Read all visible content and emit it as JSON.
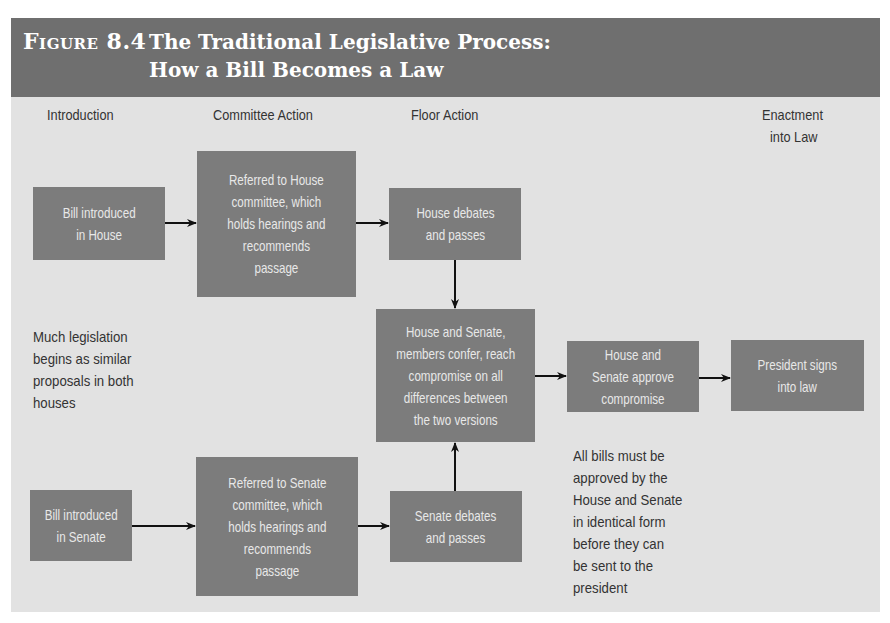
{
  "figure": {
    "label_prefix": "Figure",
    "label_number": "8.4",
    "title_line1": "The Traditional Legislative Process:",
    "title_line2": "How a Bill Becomes a Law",
    "colors": {
      "title_bar": "#6f6f6f",
      "background": "#e2e2e2",
      "box": "#7c7c7c",
      "box_text": "#e8e8e8",
      "arrow": "#111111"
    }
  },
  "stages": {
    "introduction": "Introduction",
    "committee": "Committee Action",
    "floor": "Floor Action",
    "enactment_line1": "Enactment",
    "enactment_line2": "into Law"
  },
  "boxes": {
    "house_intro": {
      "line1": "Bill introduced",
      "line2": "in House"
    },
    "house_committee": {
      "line1": "Referred to House",
      "line2": "committee, which",
      "line3": "holds hearings and",
      "line4": "recommends",
      "line5": "passage"
    },
    "house_floor": {
      "line1": "House debates",
      "line2": "and passes"
    },
    "conference": {
      "line1": "House and Senate,",
      "line2": "members confer, reach",
      "line3": "compromise on all",
      "line4": "differences between",
      "line5": "the two versions"
    },
    "approve": {
      "line1": "House and",
      "line2": "Senate approve",
      "line3": "compromise"
    },
    "president": {
      "line1": "President signs",
      "line2": "into law"
    },
    "senate_intro": {
      "line1": "Bill introduced",
      "line2": "in Senate"
    },
    "senate_committee": {
      "line1": "Referred to Senate",
      "line2": "committee, which",
      "line3": "holds hearings and",
      "line4": "recommends",
      "line5": "passage"
    },
    "senate_floor": {
      "line1": "Senate debates",
      "line2": "and passes"
    }
  },
  "notes": {
    "left": {
      "line1": "Much legislation",
      "line2": "begins as similar",
      "line3": "proposals in both",
      "line4": "houses"
    },
    "right": {
      "line1": "All bills must be",
      "line2": "approved by the",
      "line3": "House and Senate",
      "line4": "in identical form",
      "line5": "before they can",
      "line6": "be sent to the",
      "line7": "president"
    }
  }
}
